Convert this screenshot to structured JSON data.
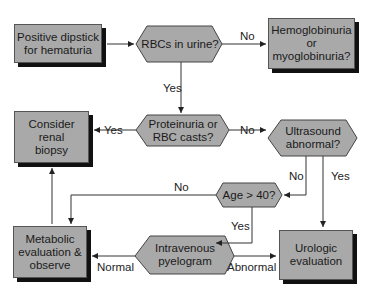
{
  "nodes": {
    "start": {
      "label_1": "Positive dipstick",
      "label_2": "for hematuria"
    },
    "rbcs": {
      "label": "RBCs in urine?"
    },
    "hemo": {
      "label_1": "Hemoglobinuria",
      "label_2": "or",
      "label_3": "myoglobinuria?"
    },
    "proteinuria": {
      "label_1": "Proteinuria or",
      "label_2": "RBC casts?"
    },
    "biopsy": {
      "label_1": "Consider",
      "label_2": "renal",
      "label_3": "biopsy"
    },
    "ultrasound": {
      "label_1": "Ultrasound",
      "label_2": "abnormal?"
    },
    "age": {
      "label": "Age > 40?"
    },
    "metabolic": {
      "label_1": "Metabolic",
      "label_2": "evaluation &",
      "label_3": "observe"
    },
    "ivp": {
      "label_1": "Intravenous",
      "label_2": "pyelogram"
    },
    "urologic": {
      "label_1": "Urologic",
      "label_2": "evaluation"
    }
  },
  "edges": {
    "rbcs_no": "No",
    "rbcs_yes": "Yes",
    "proteinuria_yes": "Yes",
    "proteinuria_no": "No",
    "ultrasound_no": "No",
    "ultrasound_yes": "Yes",
    "age_no": "No",
    "age_yes": "Yes",
    "ivp_normal": "Normal",
    "ivp_abnormal": "Abnormal"
  },
  "colors": {
    "node_fill": "#a9a9a9",
    "shadow": "#111111",
    "line": "#333333"
  }
}
